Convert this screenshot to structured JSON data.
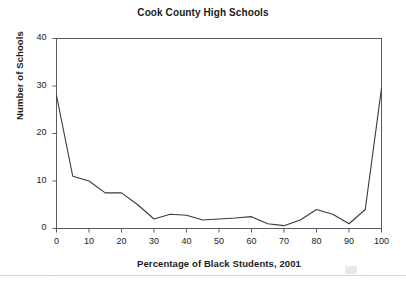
{
  "chart_data": {
    "type": "line",
    "title": "Cook County High Schools",
    "xlabel": "Percentage of Black Students, 2001",
    "ylabel": "Number of Schools",
    "xlim": [
      0,
      100
    ],
    "ylim": [
      0,
      40
    ],
    "xticks": [
      0,
      10,
      20,
      30,
      40,
      50,
      60,
      70,
      80,
      90,
      100
    ],
    "xtick_labels": [
      "0",
      "10",
      "20",
      "30",
      "40",
      "50",
      "60",
      "70",
      "80",
      "90",
      "100"
    ],
    "yticks": [
      0,
      10,
      20,
      30,
      40
    ],
    "ytick_labels": [
      "0",
      "10",
      "20",
      "30",
      "40"
    ],
    "grid": false,
    "legend": false,
    "line_color": "#3a3a3a",
    "frame_color": "#5a5a66",
    "x": [
      0,
      5,
      10,
      15,
      20,
      25,
      30,
      35,
      40,
      45,
      50,
      55,
      60,
      65,
      70,
      75,
      80,
      85,
      90,
      95,
      100
    ],
    "y": [
      28,
      11,
      10,
      7.5,
      7.5,
      5,
      2,
      3,
      2.8,
      1.8,
      2,
      2.2,
      2.5,
      1,
      0.6,
      1.8,
      4,
      3,
      1,
      4,
      29.5
    ],
    "series": [
      {
        "name": "Number of Schools",
        "values": [
          28,
          11,
          10,
          7.5,
          7.5,
          5,
          2,
          3,
          2.8,
          1.8,
          2,
          2.2,
          2.5,
          1,
          0.6,
          1.8,
          4,
          3,
          1,
          4,
          29.5
        ]
      }
    ],
    "annotations": []
  }
}
